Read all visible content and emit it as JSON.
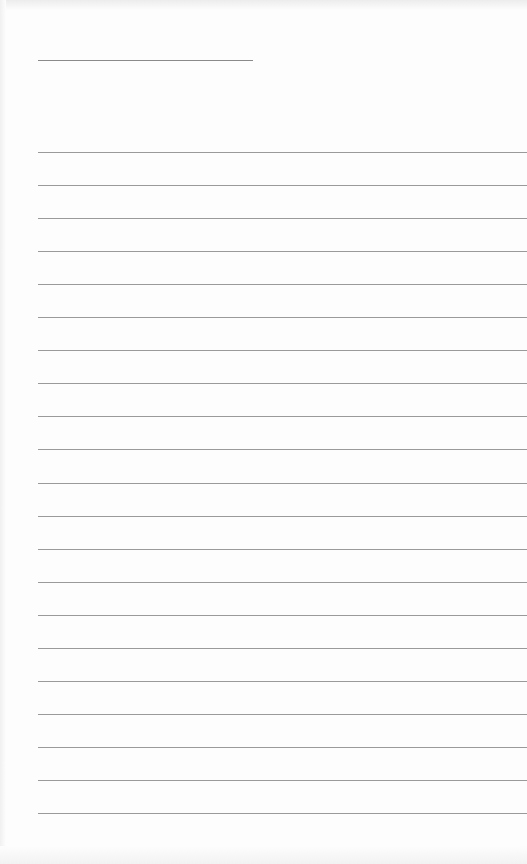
{
  "document": {
    "type": "lined-paper",
    "header_line": {
      "label": ""
    },
    "ruled_line_count": 21,
    "lines": [
      "",
      "",
      "",
      "",
      "",
      "",
      "",
      "",
      "",
      "",
      "",
      "",
      "",
      "",
      "",
      "",
      "",
      "",
      "",
      "",
      ""
    ]
  }
}
